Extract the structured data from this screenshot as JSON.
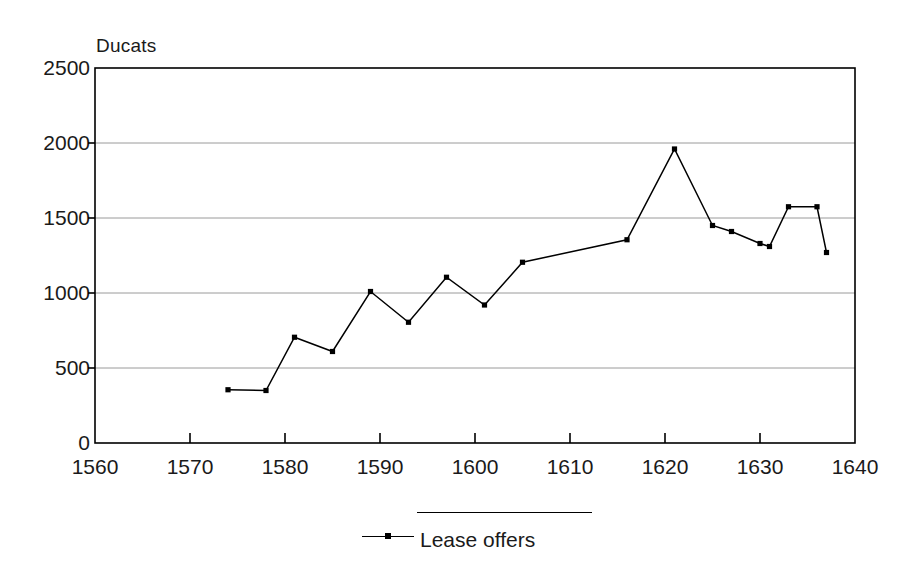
{
  "chart_data": {
    "type": "line",
    "title": "",
    "ylabel": "Ducats",
    "xlabel": "",
    "xlim": [
      1560,
      1640
    ],
    "ylim": [
      0,
      2500
    ],
    "grid": true,
    "legend_position": "bottom-center",
    "xticks": [
      1560,
      1570,
      1580,
      1590,
      1600,
      1610,
      1620,
      1630,
      1640
    ],
    "yticks": [
      0,
      500,
      1000,
      1500,
      2000,
      2500
    ],
    "series": [
      {
        "name": "Lease offers",
        "color": "#000000",
        "marker": "square",
        "x": [
          1574,
          1578,
          1581,
          1585,
          1589,
          1593,
          1597,
          1601,
          1605,
          1616,
          1621,
          1625,
          1627,
          1630,
          1631,
          1633,
          1636,
          1637
        ],
        "values": [
          355,
          350,
          705,
          610,
          1010,
          805,
          1105,
          920,
          1205,
          1355,
          1960,
          1450,
          1410,
          1330,
          1310,
          1575,
          1575,
          1270
        ]
      }
    ]
  },
  "legend": {
    "label": "Lease offers"
  },
  "axis": {
    "y_title": "Ducats"
  }
}
